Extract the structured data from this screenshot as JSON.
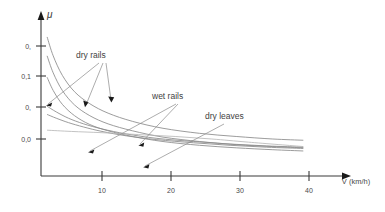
{
  "chart_data": {
    "type": "line",
    "title": "",
    "xlabel": "V (km/h)",
    "ylabel": "μ",
    "xlim": [
      0,
      43
    ],
    "ylim": [
      0,
      0.32
    ],
    "grid": false,
    "legend": "annotations",
    "x_ticks": [
      "10",
      "20",
      "30",
      "40"
    ],
    "x_tick_values": [
      10,
      20,
      30,
      40
    ],
    "y_ticks": [
      "0,",
      "0,1",
      "0,",
      "0,0"
    ],
    "y_tick_values": [
      0.25,
      0.2,
      0.15,
      0.1
    ],
    "annotations": [
      {
        "label": "dry rails",
        "targets": 3
      },
      {
        "label": "wet rails",
        "targets": 2
      },
      {
        "label": "dry leaves",
        "targets": 1
      }
    ],
    "series": [
      {
        "name": "dry rails 1",
        "group": "dry rails",
        "x": [
          1.0,
          2.0,
          3.5,
          5.5,
          8.0,
          11.0,
          15.0,
          20.0,
          26.0,
          32.0,
          38.0,
          43.0
        ],
        "y": [
          0.262,
          0.232,
          0.201,
          0.175,
          0.156,
          0.141,
          0.128,
          0.117,
          0.109,
          0.104,
          0.1,
          0.098
        ]
      },
      {
        "name": "dry rails 2",
        "group": "dry rails",
        "x": [
          1.0,
          2.0,
          3.5,
          5.5,
          8.0,
          11.0,
          15.0,
          20.0,
          26.0,
          32.0,
          38.0,
          43.0
        ],
        "y": [
          0.232,
          0.205,
          0.177,
          0.154,
          0.137,
          0.124,
          0.113,
          0.103,
          0.096,
          0.091,
          0.088,
          0.086
        ]
      },
      {
        "name": "dry rails 3",
        "group": "dry rails",
        "x": [
          1.0,
          2.0,
          3.5,
          5.5,
          8.0,
          11.0,
          15.0,
          20.0,
          26.0,
          32.0,
          38.0,
          43.0
        ],
        "y": [
          0.198,
          0.177,
          0.155,
          0.137,
          0.123,
          0.113,
          0.104,
          0.096,
          0.09,
          0.086,
          0.083,
          0.081
        ]
      },
      {
        "name": "wet rails 1",
        "group": "wet rails",
        "x": [
          1.0,
          2.5,
          4.5,
          7.0,
          10.0,
          14.0,
          19.0,
          25.0,
          31.0,
          37.0,
          43.0
        ],
        "y": [
          0.152,
          0.143,
          0.133,
          0.124,
          0.116,
          0.108,
          0.101,
          0.096,
          0.092,
          0.089,
          0.087
        ]
      },
      {
        "name": "wet rails 2",
        "group": "wet rails",
        "x": [
          1.0,
          2.5,
          4.5,
          7.0,
          10.0,
          14.0,
          19.0,
          25.0,
          31.0,
          37.0,
          43.0
        ],
        "y": [
          0.139,
          0.133,
          0.126,
          0.119,
          0.112,
          0.105,
          0.099,
          0.094,
          0.09,
          0.087,
          0.085
        ]
      },
      {
        "name": "dry leaves",
        "group": "dry leaves",
        "x": [
          1.0,
          5.0,
          10.0,
          16.0,
          22.0,
          28.0,
          34.0,
          43.0
        ],
        "y": [
          0.114,
          0.112,
          0.11,
          0.107,
          0.104,
          0.1,
          0.095,
          0.088
        ]
      }
    ]
  },
  "labels": {
    "mu": "μ",
    "axis_x": "V (km/h)",
    "y_tick_1": "0,",
    "y_tick_2": "0,1",
    "y_tick_3": "0,",
    "y_tick_4": "0,0",
    "x_tick_1": "10",
    "x_tick_2": "20",
    "x_tick_3": "30",
    "x_tick_4": "40",
    "annot_dry_rails": "dry rails",
    "annot_wet_rails": "wet rails",
    "annot_dry_leaves": "dry leaves"
  },
  "colors": {
    "axis": "#3a3a3a",
    "curve": "#8a8a8a",
    "curve_faint": "#b4b4b4",
    "text": "#4a4a4a",
    "arrowhead": "#1a1a1a",
    "background": "#ffffff"
  }
}
